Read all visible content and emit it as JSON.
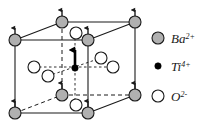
{
  "figure": {
    "colors": {
      "ba_fill": "#b0b0b0",
      "ti_fill": "#000000",
      "o_fill": "#ffffff",
      "stroke": "#1a1a1a",
      "background": "#ffffff"
    },
    "cube": {
      "front_face": [
        [
          15,
          40
        ],
        [
          88,
          40
        ],
        [
          88,
          113
        ],
        [
          15,
          113
        ]
      ],
      "back_face": [
        [
          62,
          22
        ],
        [
          135,
          22
        ],
        [
          135,
          95
        ],
        [
          62,
          95
        ]
      ],
      "solid_edges": [
        [
          [
            15,
            40
          ],
          [
            88,
            40
          ]
        ],
        [
          [
            88,
            40
          ],
          [
            88,
            113
          ]
        ],
        [
          [
            15,
            113
          ],
          [
            88,
            113
          ]
        ],
        [
          [
            15,
            40
          ],
          [
            15,
            113
          ]
        ],
        [
          [
            15,
            40
          ],
          [
            62,
            22
          ]
        ],
        [
          [
            62,
            22
          ],
          [
            135,
            22
          ]
        ],
        [
          [
            135,
            22
          ],
          [
            135,
            95
          ]
        ],
        [
          [
            88,
            40
          ],
          [
            135,
            22
          ]
        ],
        [
          [
            88,
            113
          ],
          [
            135,
            95
          ]
        ]
      ],
      "dashed_edges": [
        [
          [
            62,
            22
          ],
          [
            62,
            95
          ]
        ],
        [
          [
            15,
            113
          ],
          [
            62,
            95
          ]
        ],
        [
          [
            62,
            95
          ],
          [
            135,
            95
          ]
        ]
      ]
    },
    "atoms": {
      "ba": {
        "label": "Ba",
        "charge": "2+",
        "radius": 6,
        "positions": [
          {
            "x": 15,
            "y": 40,
            "name": "front-top-left"
          },
          {
            "x": 88,
            "y": 40,
            "name": "front-top-right"
          },
          {
            "x": 15,
            "y": 113,
            "name": "front-bottom-left"
          },
          {
            "x": 88,
            "y": 113,
            "name": "front-bottom-right"
          },
          {
            "x": 62,
            "y": 22,
            "name": "back-top-left"
          },
          {
            "x": 135,
            "y": 22,
            "name": "back-top-right"
          },
          {
            "x": 62,
            "y": 95,
            "name": "back-bottom-left"
          },
          {
            "x": 135,
            "y": 95,
            "name": "back-bottom-right"
          }
        ]
      },
      "ti": {
        "label": "Ti",
        "charge": "4+",
        "radius": 3,
        "positions": [
          {
            "x": 75,
            "y": 68,
            "name": "body-center"
          }
        ]
      },
      "o": {
        "label": "O",
        "charge": "2-",
        "radius": 6,
        "positions": [
          {
            "x": 76,
            "y": 33,
            "name": "top-face-center"
          },
          {
            "x": 76,
            "y": 105,
            "name": "bottom-face-center"
          },
          {
            "x": 34,
            "y": 67,
            "name": "left-face-center"
          },
          {
            "x": 48,
            "y": 76,
            "name": "front-face-center"
          },
          {
            "x": 101,
            "y": 58,
            "name": "back-face-center"
          },
          {
            "x": 113,
            "y": 67,
            "name": "right-face-center"
          }
        ]
      }
    },
    "arrows": {
      "ba_arrow_length": 13,
      "ti_arrow_length": 20,
      "description": "upward polarization arrows at each Ba vertex and a bold arrow at the Ti center"
    }
  },
  "legend": {
    "items": [
      {
        "marker": "filled-gray-circle",
        "symbol": "Ba",
        "charge": "2+",
        "marker_x": 158,
        "marker_y": 38,
        "text_x": 171,
        "text_y": 43
      },
      {
        "marker": "filled-black-dot",
        "symbol": "Ti",
        "charge": "4+",
        "marker_x": 158,
        "marker_y": 66,
        "text_x": 171,
        "text_y": 71
      },
      {
        "marker": "open-circle",
        "symbol": "O",
        "charge": "2-",
        "marker_x": 158,
        "marker_y": 96,
        "text_x": 171,
        "text_y": 101
      }
    ]
  }
}
